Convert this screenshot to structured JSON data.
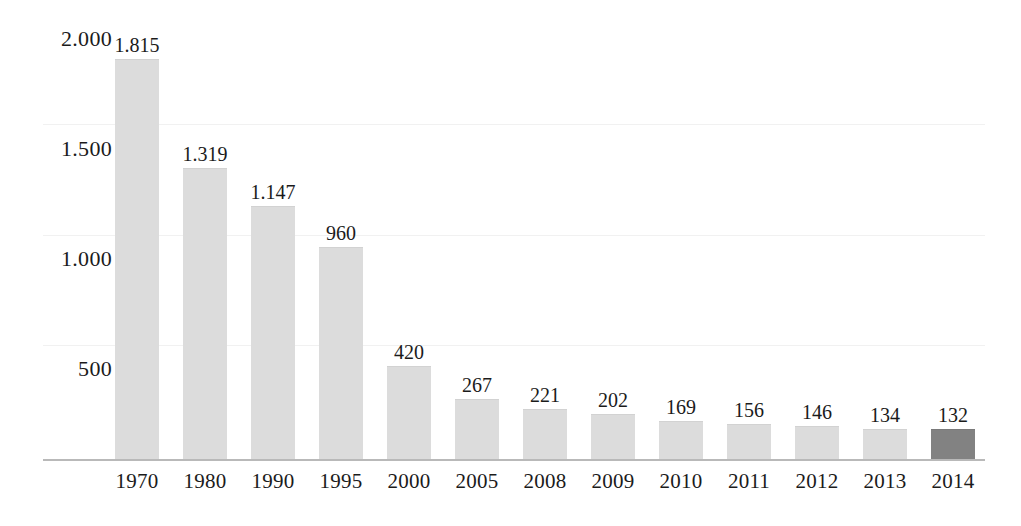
{
  "chart_data": {
    "type": "bar",
    "title": "",
    "subtitle": "",
    "xlabel": "",
    "ylabel": "",
    "categories": [
      "1970",
      "1980",
      "1990",
      "1995",
      "2000",
      "2005",
      "2008",
      "2009",
      "2010",
      "2011",
      "2012",
      "2013",
      "2014"
    ],
    "values": [
      1815,
      1319,
      1147,
      960,
      420,
      267,
      221,
      202,
      169,
      156,
      146,
      134,
      132
    ],
    "value_labels": [
      "1.815",
      "1.319",
      "1.147",
      "960",
      "420",
      "267",
      "221",
      "202",
      "169",
      "156",
      "146",
      "134",
      "132"
    ],
    "ylim": [
      0,
      2100
    ],
    "y_ticks": [
      500,
      1000,
      1500,
      2000
    ],
    "y_tick_labels": [
      "500",
      "1.000",
      "1.500",
      "2.000"
    ],
    "grid": true,
    "legend": "none",
    "series": [
      {
        "name": "",
        "values": [
          1815,
          1319,
          1147,
          960,
          420,
          267,
          221,
          202,
          169,
          156,
          146,
          134,
          132
        ]
      }
    ],
    "highlight_index": 12,
    "colors": {
      "bar": "#dcdcdc",
      "bar_highlight": "#828282",
      "axis": "#b9b9b9",
      "gridline": "#f1f1f1",
      "text": "#1b1b1b",
      "background": "#fefefe"
    }
  }
}
